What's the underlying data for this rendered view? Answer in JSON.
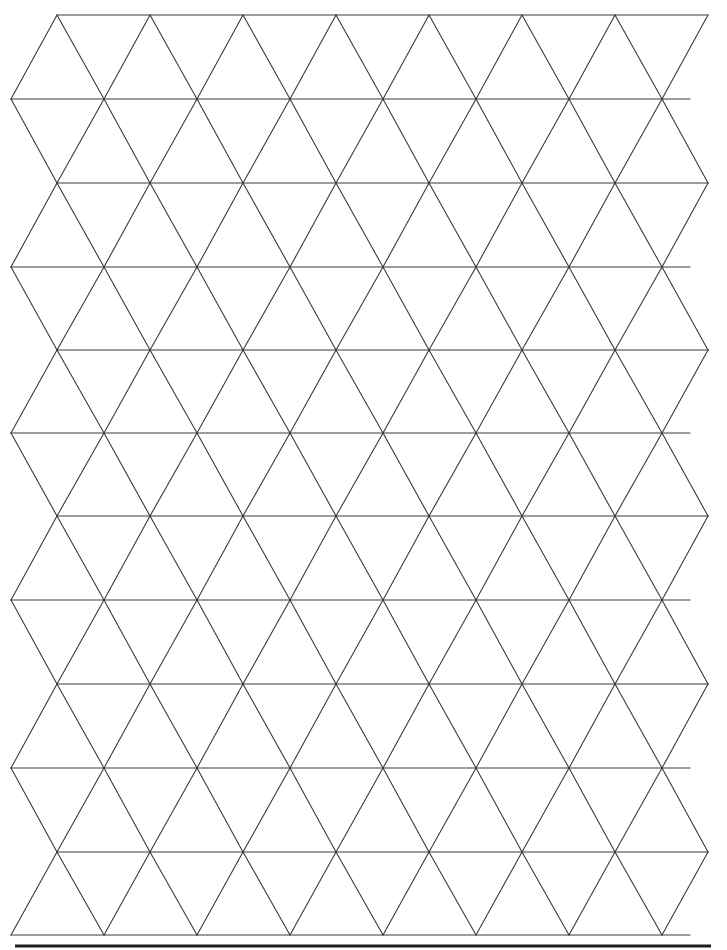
{
  "page": {
    "title": "Isometric triangle grid paper",
    "background": "#ffffff",
    "line_color": "#3a3a3a",
    "rule_color": "#1e1e1e"
  },
  "grid": {
    "type": "triangular",
    "rows": 11,
    "row_lines_y": [
      15,
      99,
      183,
      267,
      350,
      433,
      516,
      600,
      684,
      768,
      852,
      935
    ],
    "side_length": 93,
    "odd_row_vertex_x_start": 57,
    "even_row_vertex_x_start": 11,
    "vertices_per_odd_line": 8,
    "vertices_per_even_line": 8,
    "right_edge_x_odd": 706,
    "right_edge_x_even": 690
  },
  "bottom_rule": {
    "y": 946,
    "x_start": 15,
    "x_end": 711
  }
}
